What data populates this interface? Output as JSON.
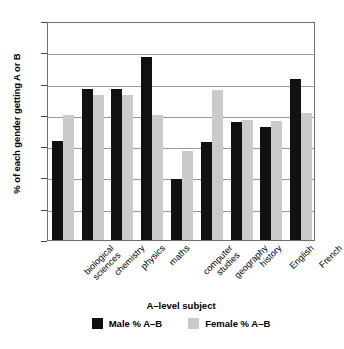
{
  "chart_data": {
    "type": "bar",
    "title": "",
    "xlabel": "A–level subject",
    "ylabel": "% of each gender getting A or B",
    "ylim": [
      0,
      35
    ],
    "yticks": [
      0,
      5,
      10,
      15,
      20,
      25,
      30,
      35
    ],
    "grid": true,
    "legend_position": "bottom",
    "categories": [
      "biological sciences",
      "chemistry",
      "physics",
      "maths",
      "computer studies",
      "geography",
      "history",
      "English",
      "French"
    ],
    "category_lines": [
      [
        "biological",
        "sciences"
      ],
      [
        "chemistry"
      ],
      [
        "physics"
      ],
      [
        "maths"
      ],
      [
        "computer",
        "studies"
      ],
      [
        "geography"
      ],
      [
        "history"
      ],
      [
        "English"
      ],
      [
        "French"
      ]
    ],
    "series": [
      {
        "name": "Male % A–B",
        "color": "#111111",
        "values": [
          15.8,
          24.2,
          24.2,
          29.2,
          9.8,
          15.6,
          18.8,
          18.0,
          25.7
        ]
      },
      {
        "name": "Female % A–B",
        "color": "#cacaca",
        "values": [
          20.0,
          23.1,
          23.1,
          20.0,
          14.2,
          24.0,
          19.2,
          19.1,
          20.3
        ]
      }
    ]
  },
  "legend": {
    "items": [
      {
        "label": "Male % A–B",
        "color": "#111111"
      },
      {
        "label": "Female % A–B",
        "color": "#cacaca"
      }
    ]
  }
}
